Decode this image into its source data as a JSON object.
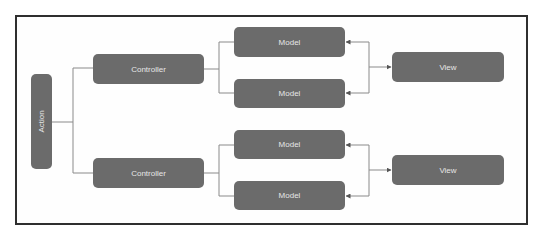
{
  "diagram": {
    "action": {
      "label": "Action"
    },
    "controllers": [
      {
        "label": "Controller"
      },
      {
        "label": "Controller"
      }
    ],
    "models": [
      {
        "label": "Model"
      },
      {
        "label": "Model"
      },
      {
        "label": "Model"
      },
      {
        "label": "Model"
      }
    ],
    "views": [
      {
        "label": "View"
      },
      {
        "label": "View"
      }
    ],
    "edges": [
      {
        "from": "Action",
        "to": "Controller 1"
      },
      {
        "from": "Action",
        "to": "Controller 2"
      },
      {
        "from": "Controller 1",
        "to": "Model 1"
      },
      {
        "from": "Controller 1",
        "to": "Model 2"
      },
      {
        "from": "Controller 2",
        "to": "Model 3"
      },
      {
        "from": "Controller 2",
        "to": "Model 4"
      },
      {
        "from": "View 1",
        "to": "Model 1",
        "arrow": true
      },
      {
        "from": "View 1",
        "to": "Model 2",
        "arrow": true
      },
      {
        "from": "View 2",
        "to": "Model 3",
        "arrow": true
      },
      {
        "from": "View 2",
        "to": "Model 4",
        "arrow": true
      }
    ],
    "colors": {
      "node_fill": "#6b6b6b",
      "node_text": "#e6e6e6",
      "line": "#7a7a7a",
      "frame": "#2f2f2f"
    }
  }
}
